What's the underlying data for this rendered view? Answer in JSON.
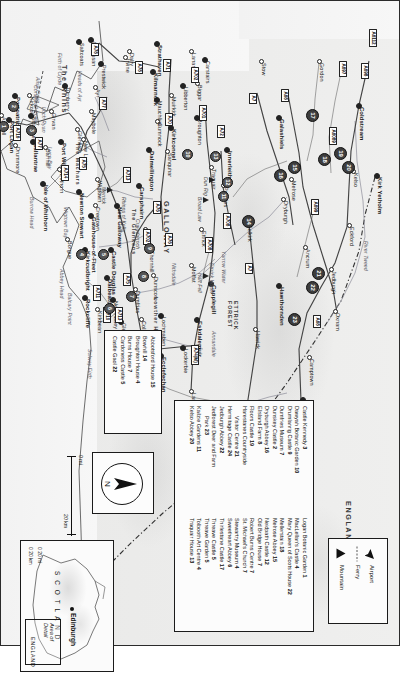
{
  "document": {
    "title": "Southern Scotland – Dumfries & Galloway and The Borders Touring Map",
    "orientation": "landscape-rotated"
  },
  "key_panel": {
    "items": [
      {
        "label": "Airport",
        "icon": "airplane-icon"
      },
      {
        "label": "Ferry",
        "icon": "ferry-dashed-line-icon"
      },
      {
        "label": "Mountain",
        "icon": "mountain-triangle-icon"
      }
    ]
  },
  "attractions_legend": {
    "columns": [
      {
        "entries": [
          {
            "name": "Abbotsford House",
            "number": "15"
          },
          {
            "name": "Bowhill",
            "number": "14"
          },
          {
            "name": "Broughton House",
            "number": "4"
          },
          {
            "name": "Burns House",
            "number": "7"
          },
          {
            "name": "Cardoness Castle",
            "number": "5"
          },
          {
            "name": "Castle Gaol",
            "number": "22"
          }
        ]
      },
      {
        "entries": [
          {
            "name": "Castle Kennedy",
            "number": "3"
          },
          {
            "name": "Dawyah Botanic Garden",
            "number": "10"
          },
          {
            "name": "Drumlanrig Castle",
            "number": "9"
          },
          {
            "name": "Dumfries Museum",
            "number": "7"
          },
          {
            "name": "Dunskey Castle",
            "number": "2"
          },
          {
            "name": "Dryburgh Abbey",
            "number": "16"
          },
          {
            "name": "Elisland Farm",
            "number": "8"
          },
          {
            "name": "Floors Castle",
            "number": "19"
          },
          {
            "name": "Harestanes Countryside",
            "number": ""
          },
          {
            "name": "Visitor Centre",
            "number": "21",
            "continuation": true
          },
          {
            "name": "Hermitage Castle",
            "number": "24"
          },
          {
            "name": "Jedburgh Abbey",
            "number": "22"
          },
          {
            "name": "Jedforest Deer and Farm",
            "number": ""
          },
          {
            "name": "Park",
            "number": "23",
            "continuation": true
          },
          {
            "name": "Kailzie Gardens",
            "number": "11"
          },
          {
            "name": "Kelso Abbey",
            "number": "20"
          }
        ]
      },
      {
        "entries": [
          {
            "name": "Logan Botanic Garden",
            "number": "1"
          },
          {
            "name": "MacLellan's Castle",
            "number": "4"
          },
          {
            "name": "Mary Queen of Scots House",
            "number": "22"
          },
          {
            "name": "Mellerstain",
            "number": "18"
          },
          {
            "name": "Melrose Abbey",
            "number": "15"
          },
          {
            "name": "Neidpath Castle",
            "number": "12"
          },
          {
            "name": "Old Bridge House",
            "number": "7"
          },
          {
            "name": "Robert Burns Centre",
            "number": "7"
          },
          {
            "name": "St. Michael's Church",
            "number": "7"
          },
          {
            "name": "Stewartry Museum",
            "number": "4"
          },
          {
            "name": "Sweetheart Abbey",
            "number": "6"
          },
          {
            "name": "Thirlestane Castle",
            "number": "17"
          },
          {
            "name": "Threave Castle",
            "number": "5"
          },
          {
            "name": "Threave Garden",
            "number": "5"
          },
          {
            "name": "Tolbooth Art Centre",
            "number": "4"
          },
          {
            "name": "Traquair House",
            "number": "13"
          }
        ]
      }
    ]
  },
  "compass": {
    "label": "N",
    "icon": "north-arrow-icon"
  },
  "scale_bar": {
    "miles": "0 mi",
    "kilometres": "20 km"
  },
  "locator_inset": {
    "country": "S C O T L A N D",
    "capital": "Edinburgh",
    "area_of_detail": "Area of\nDetail",
    "neighbour": "ENGLAND",
    "scale_miles": "0  20 mi",
    "scale_km": "0  20 km"
  },
  "map_labels": {
    "regions": [
      {
        "text": "THE\nBORDERS",
        "x": 432,
        "y": 118
      },
      {
        "text": "GALLOWAY",
        "x": 200,
        "y": 228
      },
      {
        "text": "ENGLAND",
        "x": 500,
        "y": 46
      },
      {
        "text": "ETTRICK\nFOREST",
        "x": 300,
        "y": 160
      },
      {
        "text": "The Rhins",
        "x": 64,
        "y": 330
      },
      {
        "text": "The Machars",
        "x": 142,
        "y": 318
      },
      {
        "text": "The Glenkens",
        "x": 208,
        "y": 262
      },
      {
        "text": "Lowther Hills",
        "x": 296,
        "y": 240
      }
    ],
    "towns": [
      {
        "name": "Kirk Yetholm",
        "x": 176,
        "y": 20
      },
      {
        "name": "Kelso",
        "x": 172,
        "y": 44
      },
      {
        "name": "Coldstream",
        "x": 106,
        "y": 38
      },
      {
        "name": "Gordon",
        "x": 62,
        "y": 78
      },
      {
        "name": "Eckford",
        "x": 226,
        "y": 48
      },
      {
        "name": "Jedburgh",
        "x": 270,
        "y": 66
      },
      {
        "name": "Ancrum",
        "x": 248,
        "y": 92
      },
      {
        "name": "Oxnam",
        "x": 312,
        "y": 62
      },
      {
        "name": "Camptown",
        "x": 358,
        "y": 88
      },
      {
        "name": "Southdean",
        "x": 400,
        "y": 94
      },
      {
        "name": "Melrose",
        "x": 180,
        "y": 106
      },
      {
        "name": "Dryburgh",
        "x": 200,
        "y": 114
      },
      {
        "name": "Galashiels",
        "x": 118,
        "y": 118
      },
      {
        "name": "Stow",
        "x": 62,
        "y": 136
      },
      {
        "name": "Selkirk",
        "x": 224,
        "y": 150
      },
      {
        "name": "Hawick",
        "x": 330,
        "y": 142
      },
      {
        "name": "Hawthornden",
        "x": 286,
        "y": 118
      },
      {
        "name": "Teviothead",
        "x": 440,
        "y": 150
      },
      {
        "name": "Innerleithen",
        "x": 150,
        "y": 170
      },
      {
        "name": "Peebles",
        "x": 186,
        "y": 174
      },
      {
        "name": "Traquair",
        "x": 168,
        "y": 186
      },
      {
        "name": "Broughton",
        "x": 118,
        "y": 200
      },
      {
        "name": "Lanark",
        "x": 52,
        "y": 206
      },
      {
        "name": "Biggar",
        "x": 84,
        "y": 200
      },
      {
        "name": "Carstairs",
        "x": 60,
        "y": 192
      },
      {
        "name": "Libberton",
        "x": 86,
        "y": 214
      },
      {
        "name": "Moffat",
        "x": 266,
        "y": 206
      },
      {
        "name": "Ettrick",
        "x": 230,
        "y": 196
      },
      {
        "name": "Capplegill",
        "x": 284,
        "y": 186
      },
      {
        "name": "Eskdalemuir",
        "x": 320,
        "y": 200
      },
      {
        "name": "Langholm",
        "x": 392,
        "y": 206
      },
      {
        "name": "Lockerbie",
        "x": 348,
        "y": 214
      },
      {
        "name": "Eaglesfield",
        "x": 386,
        "y": 244
      },
      {
        "name": "Ecclefechan",
        "x": 356,
        "y": 236
      },
      {
        "name": "Lochmaben",
        "x": 316,
        "y": 236
      },
      {
        "name": "Collin",
        "x": 320,
        "y": 256
      },
      {
        "name": "Dumfries",
        "x": 290,
        "y": 262
      },
      {
        "name": "Glencaple",
        "x": 322,
        "y": 276
      },
      {
        "name": "New Abbey",
        "x": 300,
        "y": 284
      },
      {
        "name": "Dalbeattie",
        "x": 278,
        "y": 290
      },
      {
        "name": "Kirkbean",
        "x": 310,
        "y": 300
      },
      {
        "name": "Rockcliffe",
        "x": 298,
        "y": 312
      },
      {
        "name": "Castle Douglas",
        "x": 250,
        "y": 286
      },
      {
        "name": "Kirkcudbright",
        "x": 250,
        "y": 312
      },
      {
        "name": "Gatehouse-of-Fleet",
        "x": 216,
        "y": 306
      },
      {
        "name": "Borgue",
        "x": 240,
        "y": 330
      },
      {
        "name": "Thornhill",
        "x": 250,
        "y": 248
      },
      {
        "name": "Dunscore",
        "x": 276,
        "y": 244
      },
      {
        "name": "Moniaive",
        "x": 230,
        "y": 252
      },
      {
        "name": "New Galloway",
        "x": 206,
        "y": 280
      },
      {
        "name": "Carsphairn",
        "x": 186,
        "y": 258
      },
      {
        "name": "Dalmellington",
        "x": 150,
        "y": 248
      },
      {
        "name": "Cumnock",
        "x": 122,
        "y": 240
      },
      {
        "name": "Mauchline",
        "x": 100,
        "y": 240
      },
      {
        "name": "Kilmarnock",
        "x": 72,
        "y": 244
      },
      {
        "name": "Strathaven",
        "x": 44,
        "y": 240
      },
      {
        "name": "Muirkirk",
        "x": 96,
        "y": 226
      },
      {
        "name": "Kirkconnel",
        "x": 128,
        "y": 226
      },
      {
        "name": "Sanquhar",
        "x": 152,
        "y": 230
      },
      {
        "name": "Irvine",
        "x": 58,
        "y": 272
      },
      {
        "name": "Prestwick",
        "x": 64,
        "y": 296
      },
      {
        "name": "Ayr",
        "x": 88,
        "y": 302
      },
      {
        "name": "Maybole",
        "x": 112,
        "y": 306
      },
      {
        "name": "Girvan",
        "x": 112,
        "y": 346
      },
      {
        "name": "Barrhill",
        "x": 148,
        "y": 352
      },
      {
        "name": "Newton Stewart",
        "x": 192,
        "y": 318
      },
      {
        "name": "Creetown",
        "x": 206,
        "y": 302
      },
      {
        "name": "Wigtown",
        "x": 180,
        "y": 300
      },
      {
        "name": "Whithorn",
        "x": 170,
        "y": 338
      },
      {
        "name": "Isle of Whithorn",
        "x": 184,
        "y": 354
      },
      {
        "name": "Port William",
        "x": 142,
        "y": 336
      },
      {
        "name": "Glenluce",
        "x": 130,
        "y": 320
      },
      {
        "name": "Kirkcolm",
        "x": 96,
        "y": 368
      },
      {
        "name": "Stranraer",
        "x": 116,
        "y": 366
      },
      {
        "name": "Portpatrick",
        "x": 96,
        "y": 382
      },
      {
        "name": "Drummore",
        "x": 146,
        "y": 382
      },
      {
        "name": "Port Logan",
        "x": 120,
        "y": 388
      },
      {
        "name": "Ballantrae",
        "x": 142,
        "y": 364
      },
      {
        "name": "New Luce",
        "x": 140,
        "y": 314
      },
      {
        "name": "Turnberry",
        "x": 86,
        "y": 332
      },
      {
        "name": "Ardrossan",
        "x": 40,
        "y": 306
      },
      {
        "name": "Saltcoats",
        "x": 42,
        "y": 318
      },
      {
        "name": "Ardwell",
        "x": 116,
        "y": 396
      },
      {
        "name": "Dalry",
        "x": 52,
        "y": 268
      }
    ],
    "waters": [
      {
        "text": "Solway Firth",
        "x": 348,
        "y": 306
      },
      {
        "text": "Luce Bay",
        "x": 146,
        "y": 346
      },
      {
        "text": "Wigtown Bay",
        "x": 206,
        "y": 330
      },
      {
        "text": "Firth of Clyde",
        "x": 52,
        "y": 336
      },
      {
        "text": "Loch Ryan",
        "x": 106,
        "y": 352
      },
      {
        "text": "River Tweed",
        "x": 240,
        "y": 30
      },
      {
        "text": "Liddesdale",
        "x": 440,
        "y": 100
      },
      {
        "text": "Eskdale",
        "x": 416,
        "y": 170
      },
      {
        "text": "Annandale",
        "x": 330,
        "y": 182
      },
      {
        "text": "Nithsdale",
        "x": 262,
        "y": 222
      },
      {
        "text": "Yarrow Water",
        "x": 250,
        "y": 172
      },
      {
        "text": "Ettrick Water",
        "x": 262,
        "y": 184
      },
      {
        "text": "Mull of Galloway",
        "x": 150,
        "y": 398
      },
      {
        "text": "Burrow Head",
        "x": 196,
        "y": 364
      },
      {
        "text": "Balcary Point",
        "x": 292,
        "y": 326
      },
      {
        "text": "Abbey Head",
        "x": 268,
        "y": 334
      },
      {
        "text": "Heads of Ayr",
        "x": 70,
        "y": 316
      },
      {
        "text": "Ailsa Craig",
        "x": 76,
        "y": 358
      },
      {
        "text": "Corsewall Point",
        "x": 84,
        "y": 360
      }
    ],
    "hills": [
      {
        "text": "Broad Law",
        "x": 196,
        "y": 196
      },
      {
        "text": "Dun Rig",
        "x": 176,
        "y": 190
      },
      {
        "text": "Merrick",
        "x": 186,
        "y": 292
      },
      {
        "text": "Rhinns of Kells",
        "x": 196,
        "y": 272
      },
      {
        "text": "Craigdarroch",
        "x": 218,
        "y": 258
      },
      {
        "text": "Hart Fell",
        "x": 272,
        "y": 196
      }
    ],
    "road_shields": [
      {
        "text": "A6112",
        "x": 28,
        "y": 22
      },
      {
        "text": "A698",
        "x": 62,
        "y": 30
      },
      {
        "text": "A697",
        "x": 60,
        "y": 52
      },
      {
        "text": "A6089",
        "x": 126,
        "y": 62
      },
      {
        "text": "A699",
        "x": 198,
        "y": 80
      },
      {
        "text": "A68",
        "x": 88,
        "y": 110
      },
      {
        "text": "A68",
        "x": 314,
        "y": 78
      },
      {
        "text": "A7",
        "x": 92,
        "y": 142
      },
      {
        "text": "A7",
        "x": 262,
        "y": 146
      },
      {
        "text": "A708",
        "x": 212,
        "y": 168
      },
      {
        "text": "A72",
        "x": 124,
        "y": 174
      },
      {
        "text": "A701",
        "x": 104,
        "y": 192
      },
      {
        "text": "A702",
        "x": 66,
        "y": 200
      },
      {
        "text": "A708",
        "x": 236,
        "y": 186
      },
      {
        "text": "A74(M)",
        "x": 344,
        "y": 200
      },
      {
        "text": "A7",
        "x": 400,
        "y": 186
      },
      {
        "text": "A75",
        "x": 368,
        "y": 250
      },
      {
        "text": "A75",
        "x": 272,
        "y": 268
      },
      {
        "text": "A710",
        "x": 306,
        "y": 288
      },
      {
        "text": "A711",
        "x": 284,
        "y": 298
      },
      {
        "text": "A713",
        "x": 306,
        "y": 276
      },
      {
        "text": "A76",
        "x": 200,
        "y": 238
      },
      {
        "text": "A70",
        "x": 112,
        "y": 226
      },
      {
        "text": "A71",
        "x": 58,
        "y": 228
      },
      {
        "text": "A77",
        "x": 96,
        "y": 292
      },
      {
        "text": "A713",
        "x": 166,
        "y": 268
      },
      {
        "text": "A75",
        "x": 156,
        "y": 312
      },
      {
        "text": "A714",
        "x": 164,
        "y": 330
      },
      {
        "text": "A716",
        "x": 124,
        "y": 378
      },
      {
        "text": "A77",
        "x": 136,
        "y": 356
      },
      {
        "text": "A78",
        "x": 42,
        "y": 300
      },
      {
        "text": "A78",
        "x": 60,
        "y": 256
      },
      {
        "text": "A76",
        "x": 232,
        "y": 226
      },
      {
        "text": "A702",
        "x": 228,
        "y": 248
      }
    ],
    "poi_markers": [
      {
        "n": "18",
        "x": 152,
        "y": 68
      },
      {
        "n": "20",
        "x": 160,
        "y": 44
      },
      {
        "n": "19",
        "x": 146,
        "y": 52
      },
      {
        "n": "17",
        "x": 108,
        "y": 80
      },
      {
        "n": "21",
        "x": 266,
        "y": 74
      },
      {
        "n": "22",
        "x": 280,
        "y": 80
      },
      {
        "n": "23",
        "x": 312,
        "y": 98
      },
      {
        "n": "15",
        "x": 160,
        "y": 98
      },
      {
        "n": "16",
        "x": 168,
        "y": 112
      },
      {
        "n": "14",
        "x": 214,
        "y": 144
      },
      {
        "n": "24",
        "x": 420,
        "y": 140
      },
      {
        "n": "13",
        "x": 150,
        "y": 178
      },
      {
        "n": "12",
        "x": 176,
        "y": 166
      },
      {
        "n": "11",
        "x": 190,
        "y": 170
      },
      {
        "n": "10",
        "x": 148,
        "y": 206
      },
      {
        "n": "9",
        "x": 242,
        "y": 244
      },
      {
        "n": "8",
        "x": 270,
        "y": 250
      },
      {
        "n": "7",
        "x": 290,
        "y": 262
      },
      {
        "n": "6",
        "x": 302,
        "y": 284
      },
      {
        "n": "5",
        "x": 248,
        "y": 290
      },
      {
        "n": "4",
        "x": 248,
        "y": 312
      },
      {
        "n": "3",
        "x": 124,
        "y": 362
      },
      {
        "n": "2",
        "x": 100,
        "y": 380
      },
      {
        "n": "1",
        "x": 120,
        "y": 390
      }
    ]
  }
}
